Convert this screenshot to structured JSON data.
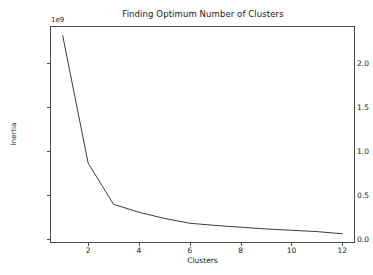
{
  "chart_data": {
    "type": "line",
    "title": "Finding Optimum Number of Clusters",
    "xlabel": "Clusters",
    "ylabel": "Inertia",
    "y_offset_text": "1e9",
    "y_offset_multiplier": 1000000000,
    "x": [
      1,
      2,
      3,
      4,
      5,
      6,
      7,
      8,
      9,
      10,
      11,
      12
    ],
    "values": [
      2.31,
      0.86,
      0.39,
      0.3,
      0.23,
      0.175,
      0.15,
      0.13,
      0.11,
      0.095,
      0.08,
      0.055
    ],
    "series": [
      {
        "name": "Inertia",
        "values": [
          2.31,
          0.86,
          0.39,
          0.3,
          0.23,
          0.175,
          0.15,
          0.13,
          0.11,
          0.095,
          0.08,
          0.055
        ]
      }
    ],
    "xlim": [
      0.5,
      12.5
    ],
    "ylim": [
      -0.05,
      2.42
    ],
    "xticks": [
      2,
      4,
      6,
      8,
      10,
      12
    ],
    "xtick_labels": [
      "2",
      "4",
      "6",
      "8",
      "10",
      "12"
    ],
    "yticks": [
      0.0,
      0.5,
      1.0,
      1.5,
      2.0
    ],
    "ytick_labels": [
      "0.0",
      "0.5",
      "1.0",
      "1.5",
      "2.0"
    ],
    "grid": false,
    "legend": false,
    "line_color": "#3c3c3c",
    "line_width": 1,
    "markers": false,
    "background_color": "#ffffff",
    "axes_edge_color": "#4a4a4a"
  }
}
